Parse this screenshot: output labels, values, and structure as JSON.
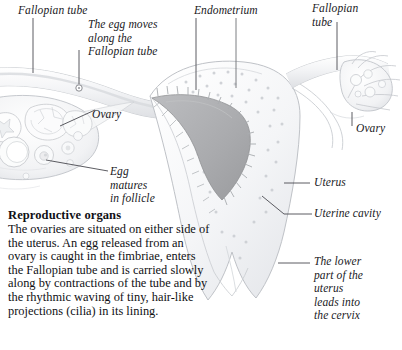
{
  "figure": {
    "title": "Reproductive organs",
    "kind": "anatomical-illustration",
    "colors": {
      "background": "#ffffff",
      "tissue_outline": "#b9bcc2",
      "tissue_fill": "#f4f5f7",
      "endometrium_fill": "#eceef1",
      "uterine_cavity_fill": "#a9aaad",
      "leader_line": "#4a4a50",
      "text": "#19191d"
    },
    "labels": [
      {
        "id": "fallopian-tube-left",
        "text": "Fallopian tube"
      },
      {
        "id": "egg-moves",
        "text": "The egg moves\nalong the\nFallopian tube"
      },
      {
        "id": "endometrium",
        "text": "Endometrium"
      },
      {
        "id": "fallopian-tube-right",
        "text": "Fallopian\ntube"
      },
      {
        "id": "ovary-left",
        "text": "Ovary"
      },
      {
        "id": "ovary-right",
        "text": "Ovary"
      },
      {
        "id": "egg-matures",
        "text": "Egg\nmatures\nin follicle"
      },
      {
        "id": "uterus",
        "text": "Uterus"
      },
      {
        "id": "uterine-cavity",
        "text": "Uterine cavity"
      },
      {
        "id": "lower-uterus",
        "text": "The lower\npart of the\nuterus\nleads into\nthe cervix"
      }
    ]
  },
  "caption": {
    "heading": "Reproductive organs",
    "body": "The ovaries are situated on either side of the uterus. An egg released from an ovary is caught in the fimbriae, enters the Fallopian tube and is carried slowly along by contractions of the tube and by the rhythmic waving of tiny, hair-like projections (cilia) in its lining."
  }
}
